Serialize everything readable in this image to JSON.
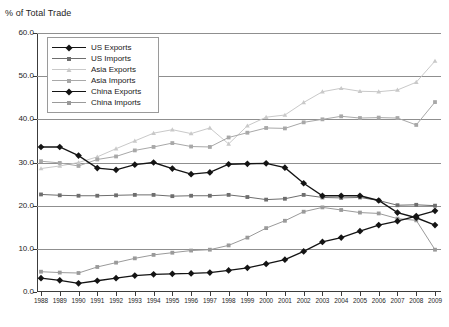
{
  "chart_title": "% of Total Trade",
  "axes": {
    "y_label": "% of Total Trade",
    "y_ticks": [
      "0.0",
      "10.0",
      "20.0",
      "30.0",
      "40.0",
      "50.0",
      "60.0"
    ],
    "y_min": 0.0,
    "y_max": 60.0,
    "x_ticks": [
      "1988",
      "1989",
      "1990",
      "1991",
      "1992",
      "1993",
      "1994",
      "1995",
      "1996",
      "1997",
      "1998",
      "1999",
      "2000",
      "2001",
      "2002",
      "2003",
      "2004",
      "2005",
      "2006",
      "2007",
      "2008",
      "2009"
    ],
    "grid": true
  },
  "legend": {
    "position": "top-left-inside",
    "entries": [
      {
        "label": "US Exports",
        "color": "#141414",
        "marker": "diamond",
        "lw": 1.4
      },
      {
        "label": "US Imports",
        "color": "#6e6e6e",
        "marker": "square",
        "lw": 1.0
      },
      {
        "label": "Asia Exports",
        "color": "#c9c9c9",
        "marker": "triangle",
        "lw": 1.0
      },
      {
        "label": "Asia Imports",
        "color": "#a8a8a8",
        "marker": "square",
        "lw": 1.0
      },
      {
        "label": "China Exports",
        "color": "#141414",
        "marker": "diamond",
        "lw": 1.4
      },
      {
        "label": "China Imports",
        "color": "#9a9a9a",
        "marker": "square",
        "lw": 1.0
      }
    ]
  },
  "chart_data": {
    "type": "line",
    "title": "% of Total Trade",
    "xlabel": "",
    "ylabel": "% of Total Trade",
    "ylim": [
      0.0,
      60.0
    ],
    "grid": true,
    "legend_position": "top-left-inside",
    "categories": [
      "1988",
      "1989",
      "1990",
      "1991",
      "1992",
      "1993",
      "1994",
      "1995",
      "1996",
      "1997",
      "1998",
      "1999",
      "2000",
      "2001",
      "2002",
      "2003",
      "2004",
      "2005",
      "2006",
      "2007",
      "2008",
      "2009"
    ],
    "series": [
      {
        "name": "US Exports",
        "color": "#141414",
        "marker": "diamond",
        "values": [
          33.6,
          33.6,
          31.6,
          28.7,
          28.3,
          29.5,
          30.0,
          28.6,
          27.3,
          27.7,
          29.6,
          29.7,
          29.8,
          28.8,
          25.2,
          22.3,
          22.3,
          22.3,
          21.2,
          18.4,
          17.2,
          15.5
        ]
      },
      {
        "name": "US Imports",
        "color": "#6e6e6e",
        "marker": "square",
        "values": [
          22.6,
          22.4,
          22.3,
          22.3,
          22.4,
          22.5,
          22.5,
          22.2,
          22.3,
          22.3,
          22.5,
          22.0,
          21.4,
          21.6,
          22.5,
          21.9,
          21.8,
          21.9,
          21.2,
          20.1,
          20.2,
          20.0
        ]
      },
      {
        "name": "Asia Exports",
        "color": "#c9c9c9",
        "marker": "triangle",
        "values": [
          28.6,
          29.2,
          30.0,
          31.3,
          33.2,
          35.0,
          36.8,
          37.6,
          36.7,
          38.0,
          34.3,
          38.5,
          40.5,
          41.0,
          43.9,
          46.4,
          47.2,
          46.5,
          46.4,
          46.8,
          48.6,
          53.5
        ]
      },
      {
        "name": "Asia Imports",
        "color": "#a8a8a8",
        "marker": "square",
        "values": [
          30.3,
          29.9,
          29.2,
          30.7,
          31.4,
          32.8,
          33.6,
          34.5,
          33.7,
          33.6,
          35.8,
          36.9,
          38.0,
          37.9,
          39.3,
          40.0,
          40.7,
          40.3,
          40.4,
          40.3,
          38.7,
          44.0
        ]
      },
      {
        "name": "China Exports",
        "color": "#141414",
        "marker": "diamond",
        "values": [
          3.2,
          2.7,
          2.0,
          2.6,
          3.2,
          3.8,
          4.1,
          4.2,
          4.3,
          4.5,
          5.0,
          5.6,
          6.5,
          7.5,
          9.4,
          11.6,
          12.6,
          14.1,
          15.5,
          16.4,
          17.6,
          18.8
        ]
      },
      {
        "name": "China Imports",
        "color": "#9a9a9a",
        "marker": "square",
        "values": [
          4.7,
          4.5,
          4.4,
          5.8,
          6.8,
          7.8,
          8.6,
          9.1,
          9.6,
          9.8,
          10.8,
          12.6,
          14.8,
          16.5,
          18.6,
          19.6,
          19.0,
          18.4,
          18.2,
          17.0,
          16.6,
          9.8
        ]
      }
    ]
  }
}
